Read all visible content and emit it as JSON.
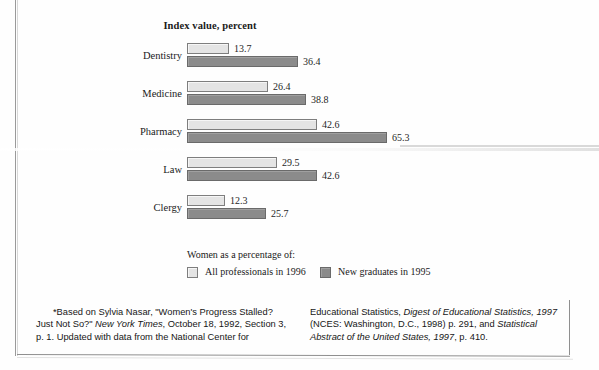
{
  "chart_data": {
    "type": "bar",
    "orientation": "horizontal",
    "title": "Index value, percent",
    "xlabel": "",
    "ylabel": "",
    "xlim": [
      0,
      70
    ],
    "grid": false,
    "legend_position": "bottom",
    "legend_caption": "Women as a percentage of:",
    "categories": [
      "Dentistry",
      "Medicine",
      "Pharmacy",
      "Law",
      "Clergy"
    ],
    "series": [
      {
        "name": "All professionals in 1996",
        "color": "#e4e4e4",
        "values": [
          13.7,
          26.4,
          42.6,
          29.5,
          12.3
        ],
        "labels": [
          "13.7",
          "26.4",
          "42.6",
          "29.5",
          "12.3"
        ]
      },
      {
        "name": "New graduates in 1995",
        "color": "#8b8b8b",
        "values": [
          36.4,
          38.8,
          65.3,
          42.6,
          25.7
        ],
        "labels": [
          "36.4",
          "38.8",
          "65.3",
          "42.6",
          "25.7"
        ]
      }
    ]
  },
  "footnote": {
    "left": {
      "line1_a": "*Based on Sylvia Nasar, \"Women's Progress Stalled?",
      "line2_a": "Just Not So?\" ",
      "line2_i": "New York Times",
      "line2_b": ", October 18, 1992, Section",
      "line3_a": "3, p. 1. Updated with data from the National Center for"
    },
    "right": {
      "line1_a": "Educational Statistics, ",
      "line1_i": "Digest of Educational Statistics,",
      "line2_i": "1997",
      "line2_b": " (NCES: Washington, D.C., 1998) p. 291, and",
      "line3_i": "Statistical Abstract of the United States, 1997",
      "line3_b": ", p. 410."
    }
  },
  "scale": {
    "px_per_unit": 3.06
  }
}
